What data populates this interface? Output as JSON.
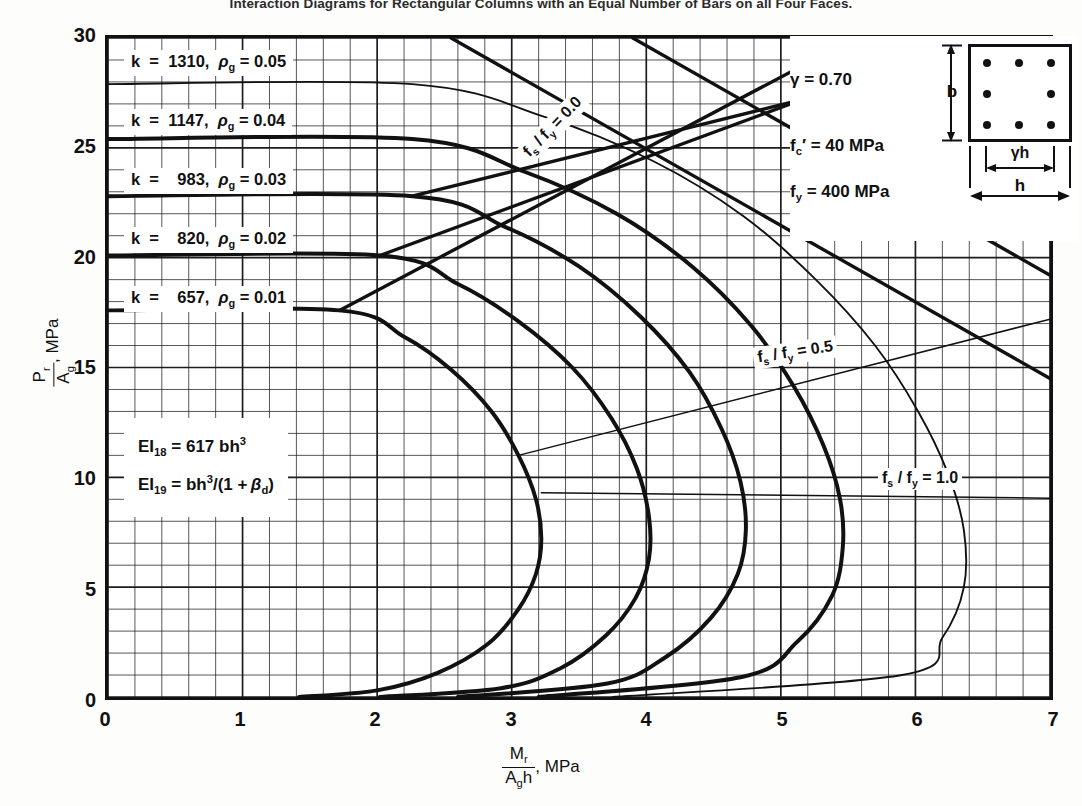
{
  "figure": {
    "title": "Interaction Diagrams for Rectangular Columns with an Equal Number of Bars on all Four Faces."
  },
  "axes": {
    "x_ticks": [
      "0",
      "1",
      "2",
      "3",
      "4",
      "5",
      "6",
      "7"
    ],
    "y_ticks": [
      "0",
      "5",
      "10",
      "15",
      "20",
      "25",
      "30"
    ],
    "x_label_num": "M",
    "x_label_num_sub": "r",
    "x_label_den": "A",
    "x_label_den_sub": "g",
    "x_label_den_tail": "h",
    "x_label_unit": ", MPa",
    "y_label_num": "P",
    "y_label_num_sub": "r",
    "y_label_den": "A",
    "y_label_den_sub": "g",
    "y_label_unit": ", MPa"
  },
  "curve_labels": [
    {
      "text": "k  =  1310,  ρg = 0.05",
      "k": 1310,
      "rho_g": 0.05
    },
    {
      "text": "k  =  1147,  ρg = 0.04",
      "k": 1147,
      "rho_g": 0.04
    },
    {
      "text": "k  =   983,  ρg = 0.03",
      "k": 983,
      "rho_g": 0.03
    },
    {
      "text": "k  =   820,  ρg = 0.02",
      "k": 820,
      "rho_g": 0.02
    },
    {
      "text": "k  =   657,  ρg = 0.01",
      "k": 657,
      "rho_g": 0.01
    }
  ],
  "fs_labels": [
    {
      "text": "f",
      "sub": "s",
      "mid": " / f",
      "sub2": "y",
      "tail": " = 0.0",
      "value": 0.0
    },
    {
      "text": "f",
      "sub": "s",
      "mid": " / f",
      "sub2": "y",
      "tail": " = 0.5",
      "value": 0.5
    },
    {
      "text": "f",
      "sub": "s",
      "mid": " / f",
      "sub2": "y",
      "tail": " = 1.0",
      "value": 1.0
    }
  ],
  "ei_notes": [
    {
      "lhs": "EI",
      "lhs_sub": "18",
      "rhs": " =  617 bh",
      "rhs_sup": "3",
      "rhs_tail": ""
    },
    {
      "lhs": "EI",
      "lhs_sub": "19",
      "rhs": " =  bh",
      "rhs_sup": "3",
      "rhs_tail": "/(1 + βd)"
    }
  ],
  "legend": {
    "gamma_sym": "γ",
    "gamma_val": " =  0.70",
    "fc_sym": "f",
    "fc_sub": "c",
    "fc_prime": "′",
    "fc_val": " =   40  MPa",
    "fy_sym": "f",
    "fy_sub": "y",
    "fy_val": " =  400  MPa",
    "b_label": "b",
    "gh_label": "γh",
    "h_label": "h",
    "bar_count": 8
  },
  "chart_data": {
    "type": "line",
    "title": "Interaction Diagrams for Rectangular Columns with an Equal Number of Bars on all Four Faces.",
    "xlabel": "Mr / (Ag h), MPa",
    "ylabel": "Pr / Ag, MPa",
    "xlim": [
      0,
      7
    ],
    "ylim": [
      0,
      30
    ],
    "x_major_step": 1,
    "y_major_step": 5,
    "x_minor_per_major": 5,
    "y_minor_per_major": 5,
    "grid": true,
    "legend_position": "in-plot-annotations",
    "series": [
      {
        "name": "rho_g = 0.01, k = 657",
        "k": 657,
        "rho_g": 0.01,
        "weight": "bold",
        "points": [
          [
            0.0,
            17.6
          ],
          [
            1.72,
            17.6
          ],
          [
            2.2,
            16.4
          ],
          [
            2.55,
            14.9
          ],
          [
            2.85,
            13.0
          ],
          [
            3.05,
            11.0
          ],
          [
            3.18,
            9.0
          ],
          [
            3.22,
            7.2
          ],
          [
            3.18,
            5.6
          ],
          [
            3.05,
            4.0
          ],
          [
            2.82,
            2.4
          ],
          [
            2.45,
            1.1
          ],
          [
            2.0,
            0.3
          ],
          [
            1.42,
            0.0
          ]
        ]
      },
      {
        "name": "rho_g = 0.02, k = 820",
        "k": 820,
        "rho_g": 0.02,
        "weight": "bold",
        "points": [
          [
            0.0,
            20.1
          ],
          [
            2.02,
            20.1
          ],
          [
            2.6,
            18.8
          ],
          [
            3.05,
            17.1
          ],
          [
            3.45,
            15.0
          ],
          [
            3.74,
            12.7
          ],
          [
            3.93,
            10.4
          ],
          [
            4.02,
            8.2
          ],
          [
            4.02,
            6.3
          ],
          [
            3.92,
            4.5
          ],
          [
            3.7,
            2.8
          ],
          [
            3.36,
            1.3
          ],
          [
            2.92,
            0.4
          ],
          [
            2.02,
            0.0
          ]
        ]
      },
      {
        "name": "rho_g = 0.03, k = 983",
        "k": 983,
        "rho_g": 0.03,
        "weight": "bold",
        "points": [
          [
            0.0,
            22.8
          ],
          [
            2.26,
            22.8
          ],
          [
            2.95,
            21.4
          ],
          [
            3.5,
            19.6
          ],
          [
            3.96,
            17.3
          ],
          [
            4.32,
            14.8
          ],
          [
            4.56,
            12.2
          ],
          [
            4.7,
            9.8
          ],
          [
            4.74,
            7.6
          ],
          [
            4.68,
            5.6
          ],
          [
            4.48,
            3.6
          ],
          [
            4.14,
            1.8
          ],
          [
            3.7,
            0.6
          ],
          [
            2.6,
            0.0
          ]
        ]
      },
      {
        "name": "rho_g = 0.04, k = 1147",
        "k": 1147,
        "rho_g": 0.04,
        "weight": "bold",
        "points": [
          [
            0.0,
            25.4
          ],
          [
            2.26,
            25.4
          ],
          [
            3.1,
            23.9
          ],
          [
            3.78,
            22.0
          ],
          [
            4.34,
            19.6
          ],
          [
            4.78,
            16.9
          ],
          [
            5.1,
            14.1
          ],
          [
            5.32,
            11.4
          ],
          [
            5.44,
            9.0
          ],
          [
            5.46,
            6.8
          ],
          [
            5.38,
            4.6
          ],
          [
            5.12,
            2.5
          ],
          [
            4.7,
            0.9
          ],
          [
            3.2,
            0.0
          ]
        ]
      },
      {
        "name": "rho_g = 0.05, k = 1310",
        "k": 1310,
        "rho_g": 0.05,
        "weight": "thin",
        "points": [
          [
            0.0,
            27.9
          ],
          [
            2.26,
            27.9
          ],
          [
            3.25,
            26.4
          ],
          [
            4.05,
            24.4
          ],
          [
            4.72,
            21.9
          ],
          [
            5.26,
            19.0
          ],
          [
            5.7,
            16.0
          ],
          [
            6.02,
            13.0
          ],
          [
            6.24,
            10.2
          ],
          [
            6.36,
            7.6
          ],
          [
            6.36,
            5.0
          ],
          [
            6.2,
            2.7
          ],
          [
            5.9,
            1.0
          ],
          [
            3.75,
            0.0
          ]
        ]
      }
    ],
    "reference_lines": [
      {
        "name": "fs/fy = 0.0",
        "label": "fs / fy = 0.0",
        "value": 0.0,
        "points": [
          [
            1.72,
            17.6
          ],
          [
            5.55,
            30.0
          ]
        ],
        "style": "solid-bold"
      },
      {
        "name": "fs/fy = 0.0 upper-fan-a",
        "points": [
          [
            2.02,
            20.1
          ],
          [
            6.4,
            30.0
          ]
        ],
        "style": "solid-bold"
      },
      {
        "name": "fs/fy = 0.0 upper-fan-b",
        "points": [
          [
            2.26,
            22.8
          ],
          [
            7.0,
            30.0
          ]
        ],
        "style": "solid-bold"
      },
      {
        "name": "descend-a",
        "points": [
          [
            2.55,
            30.0
          ],
          [
            7.0,
            14.5
          ]
        ],
        "style": "solid-bold"
      },
      {
        "name": "descend-b",
        "points": [
          [
            3.9,
            30.0
          ],
          [
            7.0,
            19.2
          ]
        ],
        "style": "solid-bold"
      },
      {
        "name": "descend-c",
        "points": [
          [
            5.25,
            30.0
          ],
          [
            7.0,
            23.9
          ]
        ],
        "style": "solid-bold"
      },
      {
        "name": "fs/fy = 0.5",
        "label": "fs / fy = 0.5",
        "value": 0.5,
        "points": [
          [
            3.05,
            11.0
          ],
          [
            7.0,
            17.2
          ]
        ],
        "style": "solid-thin"
      },
      {
        "name": "fs/fy = 1.0",
        "label": "fs / fy = 1.0",
        "value": 1.0,
        "points": [
          [
            3.22,
            9.3
          ],
          [
            7.0,
            9.05
          ]
        ],
        "style": "solid-thin"
      }
    ],
    "parameters": {
      "gamma": 0.7,
      "fc_prime_MPa": 40,
      "fy_MPa": 400,
      "EI18": "617 bh^3",
      "EI19": "bh^3/(1 + beta_d)"
    }
  }
}
